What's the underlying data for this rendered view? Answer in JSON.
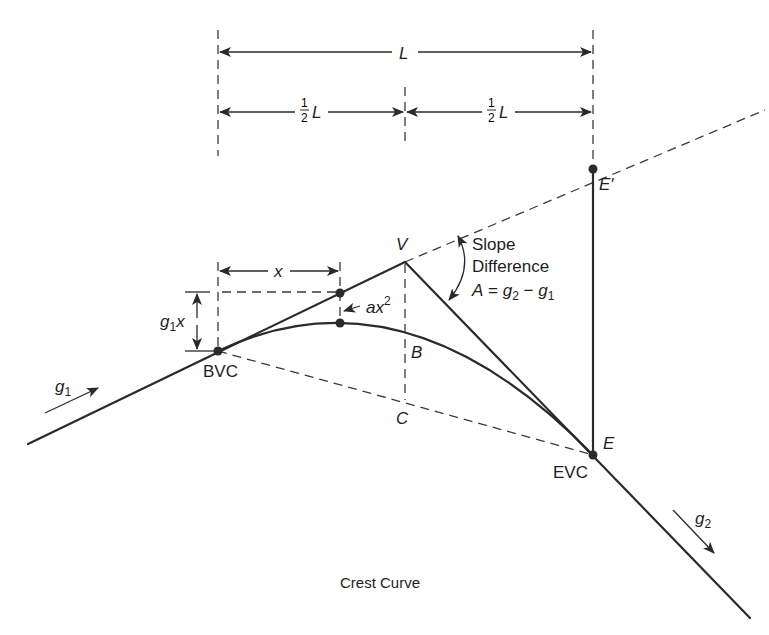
{
  "diagram": {
    "title": "Crest Curve",
    "labels": {
      "L": "L",
      "half_L_num": "1",
      "half_L_den": "2",
      "half_L_var": "L",
      "x": "x",
      "g1x_g": "g",
      "g1x_sub": "1",
      "g1x_x": "x",
      "ax2_a": "ax",
      "ax2_exp": "2",
      "V": "V",
      "B": "B",
      "C": "C",
      "E": "E",
      "E_prime": "E′",
      "BVC": "BVC",
      "EVC": "EVC",
      "g1_g": "g",
      "g1_sub": "1",
      "g2_g": "g",
      "g2_sub": "2"
    },
    "slope_annotation": {
      "line1": "Slope",
      "line2": "Difference",
      "A": "A",
      "eq": " = ",
      "g2_g": "g",
      "g2_sub": "2",
      "minus": " − ",
      "g1_g": "g",
      "g1_sub": "1"
    },
    "points": [
      "BVC",
      "V",
      "B",
      "C",
      "EVC",
      "E",
      "E′"
    ],
    "colors": {
      "ink": "#2a2a2a",
      "background": "#ffffff"
    }
  }
}
